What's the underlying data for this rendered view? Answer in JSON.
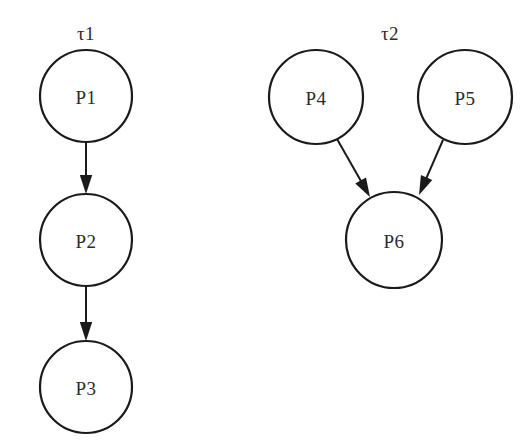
{
  "canvas": {
    "width": 527,
    "height": 448,
    "background": "#ffffff",
    "stroke_color": "#1a1a1a",
    "text_color": "#2b2b2b"
  },
  "diagram": {
    "type": "directed-graph",
    "groups": [
      {
        "id": "tau1",
        "label": "τ1",
        "label_x": 86,
        "label_y": 33
      },
      {
        "id": "tau2",
        "label": "τ2",
        "label_x": 390,
        "label_y": 33
      }
    ],
    "nodes": [
      {
        "id": "P1",
        "label": "P1",
        "cx": 86,
        "cy": 96,
        "r": 46,
        "group": "tau1"
      },
      {
        "id": "P2",
        "label": "P2",
        "cx": 86,
        "cy": 240,
        "r": 46,
        "group": "tau1"
      },
      {
        "id": "P3",
        "label": "P3",
        "cx": 86,
        "cy": 387,
        "r": 46,
        "group": "tau1"
      },
      {
        "id": "P4",
        "label": "P4",
        "cx": 316,
        "cy": 97,
        "r": 47,
        "group": "tau2"
      },
      {
        "id": "P5",
        "label": "P5",
        "cx": 465,
        "cy": 97,
        "r": 47,
        "group": "tau2"
      },
      {
        "id": "P6",
        "label": "P6",
        "cx": 394,
        "cy": 240,
        "r": 48,
        "group": "tau2"
      }
    ],
    "edges": [
      {
        "id": "P1-P2",
        "from": "P1",
        "to": "P2",
        "x1": 86,
        "y1": 142,
        "x2": 86,
        "y2": 194
      },
      {
        "id": "P2-P3",
        "from": "P2",
        "to": "P3",
        "x1": 86,
        "y1": 286,
        "x2": 86,
        "y2": 341
      },
      {
        "id": "P4-P6",
        "from": "P4",
        "to": "P6",
        "x1": 337,
        "y1": 139,
        "x2": 370,
        "y2": 197
      },
      {
        "id": "P5-P6",
        "from": "P5",
        "to": "P6",
        "x1": 443,
        "y1": 140,
        "x2": 419,
        "y2": 195
      }
    ]
  }
}
